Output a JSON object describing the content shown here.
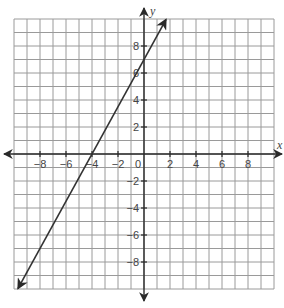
{
  "chart_data": {
    "type": "line",
    "title": "",
    "xlabel": "x",
    "ylabel": "y",
    "xlim": [
      -10,
      10
    ],
    "ylim": [
      -10,
      10
    ],
    "grid": true,
    "x_ticks": [
      -8,
      -6,
      -4,
      -2,
      0,
      2,
      4,
      6,
      8
    ],
    "y_ticks": [
      -8,
      -6,
      -4,
      -2,
      2,
      4,
      6,
      8
    ],
    "x_tick_labels": [
      "−8",
      "−6",
      "−4",
      "−2",
      "0",
      "2",
      "4",
      "6",
      "8"
    ],
    "y_tick_labels": [
      "−8",
      "−6",
      "−4",
      "−2",
      "2",
      "4",
      "6",
      "8"
    ],
    "series": [
      {
        "name": "line",
        "equation": "y = 7/4 x + 7",
        "slope": 1.75,
        "intercept": 7,
        "x": [
          -9.7,
          -4,
          0,
          1.7
        ],
        "y": [
          -9.975,
          0,
          7,
          9.975
        ],
        "arrows": "both"
      }
    ],
    "key_points": [
      {
        "label": "x-intercept",
        "x": -4,
        "y": 0
      },
      {
        "label": "y-intercept",
        "x": 0,
        "y": 7
      }
    ]
  },
  "labels": {
    "x_axis": "x",
    "y_axis": "y",
    "origin": "0"
  }
}
